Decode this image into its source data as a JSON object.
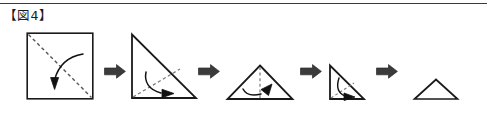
{
  "figure": {
    "label": "【図4】",
    "top_rule_color": "#3a3a3a"
  },
  "colors": {
    "outline": "#1a1a1a",
    "fold_line": "#555555",
    "motion_arrow": "#111111",
    "step_arrow": "#3b3b3b",
    "background": "#ffffff"
  },
  "diagram": {
    "type": "origami-fold-sequence",
    "step_count": 5,
    "arrow_count": 4,
    "steps": [
      {
        "index": 1,
        "name": "square-with-diagonal-fold",
        "shape": "square",
        "has_fold_line": true,
        "fold_line": "diagonal-top-left-to-bottom-right",
        "has_motion_arrow": true,
        "motion_arrow": "curved-arrow-down-left"
      },
      {
        "index": 2,
        "name": "right-triangle-with-fold",
        "shape": "right-triangle",
        "has_fold_line": true,
        "fold_line": "corner-to-hypotenuse-midpoint",
        "has_motion_arrow": true,
        "motion_arrow": "curved-arrow-right"
      },
      {
        "index": 3,
        "name": "isoceles-triangle-with-vertical-fold",
        "shape": "isoceles-triangle",
        "has_fold_line": true,
        "fold_line": "vertical-apex-to-base",
        "has_motion_arrow": true,
        "motion_arrow": "curved-arrow-right"
      },
      {
        "index": 4,
        "name": "small-right-triangle-with-fold",
        "shape": "right-triangle",
        "has_fold_line": true,
        "fold_line": "diagonal-short",
        "has_motion_arrow": true,
        "motion_arrow": "curved-arrow-down-right"
      },
      {
        "index": 5,
        "name": "final-small-triangle",
        "shape": "isoceles-triangle",
        "has_fold_line": false,
        "fold_line": null,
        "has_motion_arrow": false,
        "motion_arrow": null
      }
    ],
    "arrows": [
      {
        "index": 1,
        "name": "step-arrow-1",
        "direction": "right"
      },
      {
        "index": 2,
        "name": "step-arrow-2",
        "direction": "right"
      },
      {
        "index": 3,
        "name": "step-arrow-3",
        "direction": "right"
      },
      {
        "index": 4,
        "name": "step-arrow-4",
        "direction": "right"
      }
    ]
  }
}
